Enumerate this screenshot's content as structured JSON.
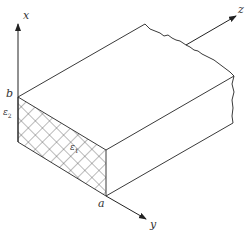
{
  "diagram": {
    "title": "",
    "axes": {
      "x": "x",
      "y": "y",
      "z": "z"
    },
    "points": {
      "a": "a",
      "b": "b"
    },
    "regions": {
      "epsilon1": {
        "symbol": "ε",
        "subscript": "1"
      },
      "epsilon2": {
        "symbol": "ε",
        "subscript": "2"
      }
    },
    "colors": {
      "line": "#3a3a3a",
      "hatch": "#555555",
      "background": "#ffffff"
    }
  }
}
